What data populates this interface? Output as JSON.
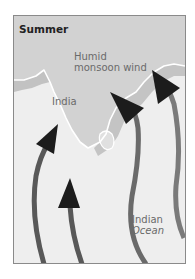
{
  "figure": {
    "title": "Summer",
    "labels": {
      "wind_line1": "Humid",
      "wind_line2": "monsoon wind",
      "country": "India",
      "ocean_line1": "Indian",
      "ocean_line2": "Ocean"
    },
    "colors": {
      "land": "#d2d2d2",
      "coast_band": "#c2c2c2",
      "ocean": "#eeeeee",
      "coastline": "#ffffff",
      "arrow_shaft": "#555555",
      "arrow_head": "#1c1c1c",
      "frame_border": "#8a8a8a"
    },
    "arrows": [
      {
        "name": "arrow-far-left",
        "direction": "north"
      },
      {
        "name": "arrow-left-short",
        "direction": "north"
      },
      {
        "name": "arrow-center-right",
        "direction": "north-west"
      },
      {
        "name": "arrow-right",
        "direction": "north-west"
      }
    ]
  }
}
